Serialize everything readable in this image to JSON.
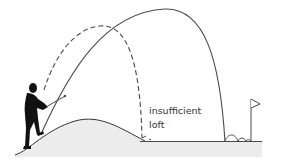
{
  "diagram": {
    "title": "",
    "labels": {
      "line1": "insufficient",
      "line2": "loft"
    },
    "elements": [
      {
        "name": "golfer",
        "description": "silhouette of golfer swinging on hill"
      },
      {
        "name": "hill",
        "description": "grassy mound the golfer stands on"
      },
      {
        "name": "solid-trajectory",
        "description": "high arc reaching the green beside the flag"
      },
      {
        "name": "dashed-trajectory",
        "description": "shorter arc falling short, annotated insufficient loft"
      },
      {
        "name": "ball-bounces",
        "description": "small bounces near the flag"
      },
      {
        "name": "flag",
        "description": "pin flag on the green"
      }
    ],
    "colors": {
      "line": "#4a4a4a",
      "ground": "#ececec",
      "silhouette": "#111111",
      "text": "#333333"
    }
  }
}
